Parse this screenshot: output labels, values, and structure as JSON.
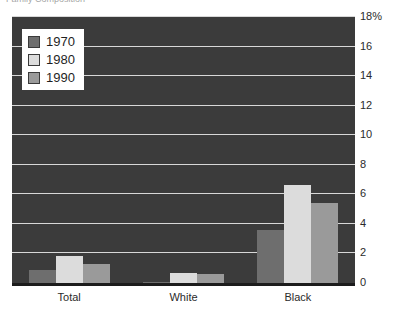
{
  "title_remnant": "Family Composition",
  "chart_data": {
    "type": "bar",
    "title": "",
    "xlabel": "",
    "ylabel": "",
    "categories": [
      "Total",
      "White",
      "Black"
    ],
    "series": [
      {
        "name": "1970",
        "color": "#6e6e6e",
        "values": [
          0.9,
          0.1,
          3.6
        ]
      },
      {
        "name": "1980",
        "color": "#dcdcdc",
        "values": [
          1.8,
          0.7,
          6.6
        ]
      },
      {
        "name": "1990",
        "color": "#9a9a9a",
        "values": [
          1.3,
          0.6,
          5.4
        ]
      }
    ],
    "ylim": [
      0,
      18
    ],
    "yticks": [
      0,
      2,
      4,
      6,
      8,
      10,
      12,
      14,
      16,
      18
    ],
    "ytick_labels": [
      "0",
      "2",
      "4",
      "6",
      "8",
      "10",
      "12",
      "14",
      "16",
      "18%"
    ],
    "grid": true,
    "gridline_color": "#d8d8d8",
    "plot_background": "#3b3b3b",
    "legend_position": "top-left",
    "legend_entries": [
      "1970",
      "1980",
      "1990"
    ]
  }
}
